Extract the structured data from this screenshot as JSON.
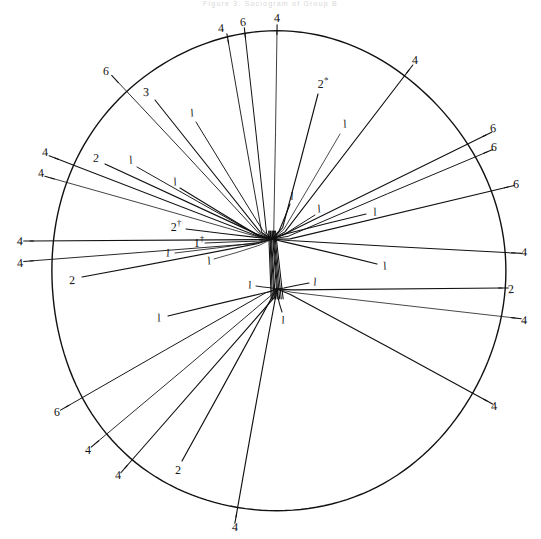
{
  "figure": {
    "caption_top": "Figure 3.  Sociogram  of  Group  B",
    "type": "sociogram",
    "ink_color": "#111111",
    "paper_color": "#ffffff"
  },
  "circle": {
    "name": "group-boundary-circle",
    "cx": 277,
    "cy": 272,
    "rx": 227,
    "ry": 240,
    "stroke": "#111111",
    "stroke_width": 1.4
  },
  "hubs": [
    {
      "name": "upper-hub",
      "x": 272,
      "y": 239
    },
    {
      "name": "lower-hub",
      "x": 277,
      "y": 289
    }
  ],
  "chart_data": {
    "type": "scatter",
    "title": "Figure 3.  Sociogram  of  Group  B",
    "xlabel": "",
    "ylabel": "",
    "nodes": [
      {
        "id": "hub-upper",
        "x": 272,
        "y": 239,
        "label": ""
      },
      {
        "id": "hub-lower",
        "x": 277,
        "y": 289,
        "label": ""
      }
    ],
    "spokes": [
      {
        "label": "4",
        "lx": 221,
        "ly": 28,
        "x1": 228,
        "y1": 40,
        "x2": 262,
        "y2": 232,
        "hub": "upper"
      },
      {
        "label": "6",
        "lx": 243,
        "ly": 22,
        "x1": 245,
        "y1": 34,
        "x2": 267,
        "y2": 233,
        "hub": "upper"
      },
      {
        "label": "4",
        "lx": 277,
        "ly": 18,
        "x1": 277,
        "y1": 31,
        "x2": 274,
        "y2": 231,
        "hub": "upper"
      },
      {
        "label": "4",
        "lx": 415,
        "ly": 60,
        "x1": 409,
        "y1": 70,
        "x2": 285,
        "y2": 232,
        "hub": "upper"
      },
      {
        "label": "2*",
        "lx": 323,
        "ly": 83,
        "x1": 318,
        "y1": 94,
        "x2": 282,
        "y2": 228,
        "hub": "upper"
      },
      {
        "label": "6",
        "lx": 106,
        "ly": 71,
        "x1": 116,
        "y1": 80,
        "x2": 258,
        "y2": 233,
        "hub": "upper"
      },
      {
        "label": "3",
        "lx": 146,
        "ly": 92,
        "x1": 155,
        "y1": 100,
        "x2": 260,
        "y2": 232,
        "hub": "upper"
      },
      {
        "label": "1",
        "lx": 192,
        "ly": 113,
        "x1": 196,
        "y1": 122,
        "x2": 263,
        "y2": 231,
        "hub": "upper"
      },
      {
        "label": "1",
        "lx": 345,
        "ly": 124,
        "x1": 340,
        "y1": 134,
        "x2": 284,
        "y2": 230,
        "hub": "upper"
      },
      {
        "label": "6",
        "lx": 493,
        "ly": 128,
        "x1": 486,
        "y1": 135,
        "x2": 288,
        "y2": 233,
        "hub": "upper"
      },
      {
        "label": "6",
        "lx": 494,
        "ly": 147,
        "x1": 487,
        "y1": 152,
        "x2": 288,
        "y2": 236,
        "hub": "upper"
      },
      {
        "label": "6",
        "lx": 516,
        "ly": 184,
        "x1": 508,
        "y1": 187,
        "x2": 290,
        "y2": 239,
        "hub": "upper"
      },
      {
        "label": "4",
        "lx": 45,
        "ly": 152,
        "x1": 55,
        "y1": 158,
        "x2": 256,
        "y2": 235,
        "hub": "upper"
      },
      {
        "label": "2",
        "lx": 96,
        "ly": 158,
        "x1": 105,
        "y1": 164,
        "x2": 257,
        "y2": 234,
        "hub": "upper"
      },
      {
        "label": "1",
        "lx": 131,
        "ly": 160,
        "x1": 137,
        "y1": 167,
        "x2": 258,
        "y2": 235,
        "hub": "upper"
      },
      {
        "label": "4",
        "lx": 41,
        "ly": 173,
        "x1": 51,
        "y1": 178,
        "x2": 256,
        "y2": 237,
        "hub": "upper"
      },
      {
        "label": "1",
        "lx": 175,
        "ly": 182,
        "x1": 180,
        "y1": 188,
        "x2": 260,
        "y2": 236,
        "hub": "upper"
      },
      {
        "label": "1",
        "lx": 292,
        "ly": 196,
        "x1": 290,
        "y1": 204,
        "x2": 279,
        "y2": 231,
        "hub": "upper"
      },
      {
        "label": "1",
        "lx": 319,
        "ly": 209,
        "x1": 315,
        "y1": 215,
        "x2": 284,
        "y2": 234,
        "hub": "upper"
      },
      {
        "label": "1",
        "lx": 375,
        "ly": 212,
        "x1": 366,
        "y1": 214,
        "x2": 287,
        "y2": 233,
        "hub": "upper"
      },
      {
        "label": "2†",
        "lx": 176,
        "ly": 226,
        "x1": 186,
        "y1": 229,
        "x2": 261,
        "y2": 238,
        "hub": "upper"
      },
      {
        "label": "4",
        "lx": 20,
        "ly": 241,
        "x1": 30,
        "y1": 241,
        "x2": 257,
        "y2": 240,
        "hub": "upper"
      },
      {
        "label": "1†",
        "lx": 199,
        "ly": 242,
        "x1": 205,
        "y1": 243,
        "x2": 258,
        "y2": 241,
        "hub": "upper"
      },
      {
        "label": "4",
        "lx": 20,
        "ly": 263,
        "x1": 30,
        "y1": 261,
        "x2": 256,
        "y2": 243,
        "hub": "upper"
      },
      {
        "label": "1",
        "lx": 168,
        "ly": 253,
        "x1": 175,
        "y1": 253,
        "x2": 258,
        "y2": 243,
        "hub": "upper"
      },
      {
        "label": "1",
        "lx": 209,
        "ly": 261,
        "x1": 214,
        "y1": 259,
        "x2": 260,
        "y2": 245,
        "hub": "upper"
      },
      {
        "label": "2",
        "lx": 72,
        "ly": 280,
        "x1": 82,
        "y1": 277,
        "x2": 258,
        "y2": 244,
        "hub": "upper"
      },
      {
        "label": "4",
        "lx": 524,
        "ly": 252,
        "x1": 515,
        "y1": 253,
        "x2": 290,
        "y2": 240,
        "hub": "upper"
      },
      {
        "label": "1",
        "lx": 385,
        "ly": 266,
        "x1": 377,
        "y1": 264,
        "x2": 288,
        "y2": 243,
        "hub": "upper"
      },
      {
        "label": "2",
        "lx": 511,
        "ly": 289,
        "x1": 502,
        "y1": 288,
        "x2": 292,
        "y2": 290,
        "hub": "lower"
      },
      {
        "label": "4",
        "lx": 524,
        "ly": 320,
        "x1": 515,
        "y1": 318,
        "x2": 292,
        "y2": 292,
        "hub": "lower"
      },
      {
        "label": "1",
        "lx": 250,
        "ly": 285,
        "x1": 256,
        "y1": 286,
        "x2": 270,
        "y2": 288,
        "hub": "lower"
      },
      {
        "label": "1",
        "lx": 315,
        "ly": 282,
        "x1": 309,
        "y1": 283,
        "x2": 284,
        "y2": 288,
        "hub": "lower"
      },
      {
        "label": "1",
        "lx": 159,
        "ly": 318,
        "x1": 168,
        "y1": 316,
        "x2": 270,
        "y2": 292,
        "hub": "lower"
      },
      {
        "label": "1",
        "lx": 283,
        "ly": 320,
        "x1": 282,
        "y1": 312,
        "x2": 278,
        "y2": 296,
        "hub": "lower"
      },
      {
        "label": "4",
        "lx": 494,
        "ly": 406,
        "x1": 487,
        "y1": 401,
        "x2": 290,
        "y2": 295,
        "hub": "lower"
      },
      {
        "label": "6",
        "lx": 57,
        "ly": 412,
        "x1": 66,
        "y1": 407,
        "x2": 266,
        "y2": 293,
        "hub": "lower"
      },
      {
        "label": "4",
        "lx": 88,
        "ly": 450,
        "x1": 96,
        "y1": 443,
        "x2": 270,
        "y2": 296,
        "hub": "lower"
      },
      {
        "label": "4",
        "lx": 118,
        "ly": 475,
        "x1": 125,
        "y1": 468,
        "x2": 274,
        "y2": 297,
        "hub": "lower"
      },
      {
        "label": "2",
        "lx": 178,
        "ly": 470,
        "x1": 182,
        "y1": 461,
        "x2": 272,
        "y2": 297,
        "hub": "lower"
      },
      {
        "label": "4",
        "lx": 235,
        "ly": 527,
        "x1": 236,
        "y1": 517,
        "x2": 276,
        "y2": 298,
        "hub": "lower"
      }
    ],
    "label_values_summary": {
      "1": 15,
      "2": 5,
      "2*": 1,
      "2†": 1,
      "1†": 1,
      "3": 1,
      "4": 14,
      "6": 6
    },
    "grid": false,
    "legend": "none"
  }
}
